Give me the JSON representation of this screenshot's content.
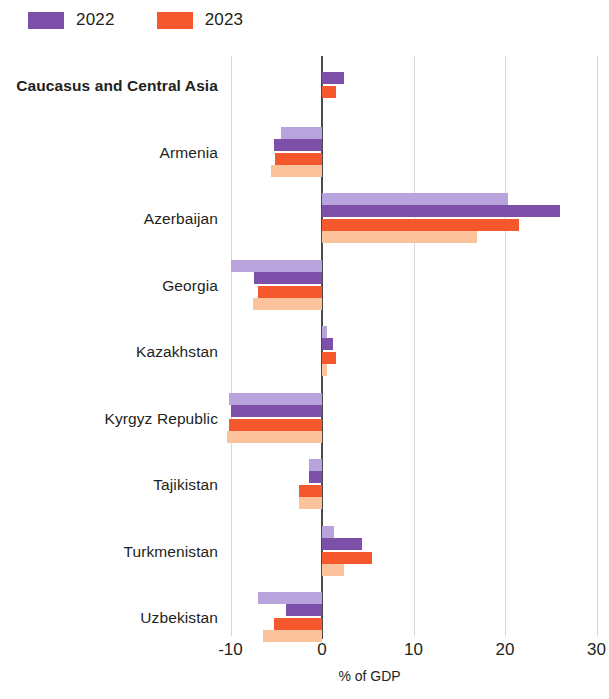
{
  "legend": {
    "items": [
      {
        "label": "2022",
        "color": "#7c4fa8",
        "name": "legend-2022"
      },
      {
        "label": "2023",
        "color": "#f4582c",
        "name": "legend-2023"
      }
    ]
  },
  "axis": {
    "ticks": [
      "-10",
      "0",
      "10",
      "20",
      "30"
    ],
    "title": "% of GDP"
  },
  "chart_data": {
    "type": "bar",
    "orientation": "horizontal",
    "title": "",
    "subtitle": "",
    "xlabel": "% of GDP",
    "ylabel": "",
    "xlim": [
      -10,
      30
    ],
    "xticks": [
      -10,
      0,
      10,
      20,
      30
    ],
    "grid": true,
    "legend_position": "top-left",
    "legend": [
      "2022",
      "2023"
    ],
    "colors": {
      "2022_dark": "#7c4fa8",
      "2022_pale": "#b9a3dc",
      "2023_dark": "#f4582c",
      "2023_pale": "#fbc39c"
    },
    "categories": [
      "Caucasus and Central Asia",
      "Armenia",
      "Azerbaijan",
      "Georgia",
      "Kazakhstan",
      "Kyrgyz Republic",
      "Tajikistan",
      "Turkmenistan",
      "Uzbekistan"
    ],
    "series": [
      {
        "name": "2022 (pale)",
        "color": "#b9a3dc",
        "values": [
          null,
          -4.5,
          20.3,
          -10.0,
          0.5,
          -10.2,
          -1.4,
          1.3,
          -7.0
        ]
      },
      {
        "name": "2022",
        "color": "#7c4fa8",
        "values": [
          2.4,
          -5.2,
          26.0,
          -7.4,
          1.2,
          -10.0,
          -1.4,
          4.4,
          -3.9
        ]
      },
      {
        "name": "2023",
        "color": "#f4582c",
        "values": [
          1.5,
          -5.1,
          21.5,
          -7.0,
          1.5,
          -10.2,
          -2.5,
          5.5,
          -5.3
        ]
      },
      {
        "name": "2023 (pale)",
        "color": "#fbc39c",
        "values": [
          null,
          -5.6,
          16.9,
          -7.5,
          0.5,
          -10.4,
          -2.5,
          2.4,
          -6.4
        ]
      }
    ]
  }
}
